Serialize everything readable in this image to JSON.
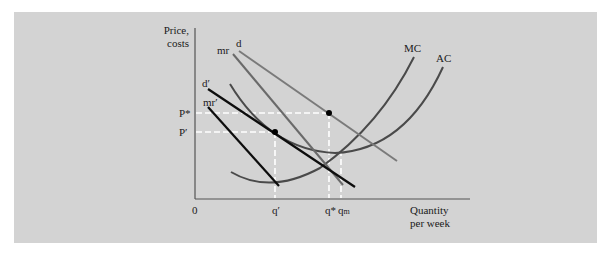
{
  "figure": {
    "background": "#d3d3d3",
    "y_axis_label_line1": "Price,",
    "y_axis_label_line2": "costs",
    "x_axis_label_line1": "Quantity",
    "x_axis_label_line2": "per week",
    "origin_label": "0",
    "price_labels": {
      "p_star": "P*",
      "p_prime": "P′"
    },
    "quantity_labels": {
      "q_prime": "q′",
      "q_star": "q*",
      "q_m": "q",
      "q_m_sub": "m"
    },
    "curve_labels": {
      "mc": "MC",
      "ac": "AC",
      "d": "d",
      "mr": "mr",
      "d_prime": "d′",
      "mr_prime": "mr′"
    },
    "colors": {
      "dark_lines": "#0d0d0d",
      "gray_lines": "#6e6e6e",
      "cost_curves": "#4a4a4a",
      "dashed_guides": "#ffffff"
    }
  }
}
